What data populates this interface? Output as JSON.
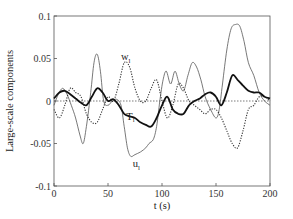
{
  "chart_data": {
    "type": "line",
    "title": "",
    "xlabel": "t (s)",
    "ylabel": "Large-scale components",
    "xlim": [
      0,
      200
    ],
    "ylim": [
      -0.1,
      0.1
    ],
    "xticks": [
      0,
      50,
      100,
      150,
      200
    ],
    "xtick_labels": [
      "0",
      "50",
      "100",
      "150",
      "200"
    ],
    "yticks": [
      -0.1,
      -0.05,
      0,
      0.05,
      0.1
    ],
    "ytick_labels": [
      "-0.1",
      "-0.05",
      "0",
      "0.05",
      "0.1"
    ],
    "grid": false,
    "zero_line": {
      "style": "dotted",
      "y": 0
    },
    "legend": "inline annotations",
    "annotations": [
      {
        "text": "w",
        "sub": "l",
        "t": 62,
        "v": 0.048,
        "series": "w_l"
      },
      {
        "text": "T",
        "sub": "l",
        "t": 67,
        "v": -0.022,
        "series": "T_l"
      },
      {
        "text": "u",
        "sub": "l",
        "t": 73,
        "v": -0.078,
        "series": "u_l"
      }
    ],
    "series": [
      {
        "name": "u_l",
        "style": "thin-solid",
        "color": "#555555",
        "x": [
          0,
          4,
          8,
          12,
          16,
          20,
          24,
          27,
          30,
          34,
          37,
          40,
          43,
          46,
          50,
          54,
          58,
          62,
          65,
          68,
          71,
          75,
          80,
          85,
          88,
          92,
          95,
          98,
          101,
          104,
          108,
          112,
          116,
          120,
          124,
          128,
          132,
          136,
          140,
          145,
          150,
          153,
          156,
          160,
          164,
          168,
          172,
          176,
          180,
          185,
          190,
          195,
          200
        ],
        "values": [
          -0.005,
          0.008,
          0.015,
          0.008,
          -0.005,
          -0.02,
          -0.04,
          -0.05,
          -0.03,
          0.01,
          0.045,
          0.055,
          0.035,
          0.0,
          -0.005,
          0.0,
          0.002,
          -0.005,
          -0.03,
          -0.055,
          -0.065,
          -0.063,
          -0.06,
          -0.055,
          -0.05,
          -0.045,
          -0.03,
          0.0,
          0.025,
          0.035,
          0.02,
          0.035,
          0.02,
          0.012,
          0.03,
          0.045,
          0.04,
          0.025,
          0.005,
          -0.01,
          -0.02,
          -0.01,
          0.02,
          0.06,
          0.085,
          0.09,
          0.088,
          0.07,
          0.045,
          0.03,
          0.01,
          0.0,
          -0.005
        ]
      },
      {
        "name": "w_l",
        "style": "dotted",
        "color": "#333333",
        "x": [
          0,
          5,
          10,
          15,
          20,
          25,
          30,
          35,
          40,
          45,
          50,
          55,
          60,
          65,
          70,
          75,
          80,
          85,
          90,
          95,
          100,
          105,
          110,
          115,
          120,
          125,
          130,
          135,
          140,
          145,
          150,
          155,
          160,
          165,
          170,
          175,
          180,
          185,
          190,
          195,
          200
        ],
        "values": [
          -0.01,
          -0.02,
          -0.005,
          0.015,
          0.01,
          0.005,
          -0.015,
          -0.025,
          -0.025,
          -0.01,
          0.005,
          0.0,
          0.02,
          0.045,
          0.04,
          0.015,
          0.0,
          0.0,
          0.015,
          0.025,
          0.0,
          -0.02,
          -0.005,
          0.02,
          0.015,
          0.0,
          -0.005,
          -0.01,
          -0.015,
          -0.01,
          -0.01,
          -0.02,
          -0.035,
          -0.05,
          -0.055,
          -0.035,
          -0.01,
          -0.005,
          0.005,
          0.005,
          0.0
        ]
      },
      {
        "name": "T_l",
        "style": "thick-solid",
        "color": "#111111",
        "x": [
          0,
          5,
          10,
          15,
          20,
          25,
          30,
          35,
          40,
          45,
          50,
          55,
          60,
          65,
          70,
          75,
          80,
          85,
          90,
          95,
          100,
          105,
          110,
          115,
          120,
          125,
          130,
          135,
          140,
          145,
          150,
          155,
          160,
          165,
          170,
          175,
          180,
          185,
          190,
          195,
          200
        ],
        "values": [
          0.003,
          0.01,
          0.012,
          0.008,
          0.003,
          -0.002,
          -0.005,
          0.005,
          0.015,
          0.01,
          0.0,
          0.002,
          -0.005,
          -0.015,
          -0.018,
          -0.02,
          -0.025,
          -0.028,
          -0.03,
          -0.02,
          -0.005,
          0.005,
          -0.01,
          -0.015,
          -0.015,
          -0.005,
          0.0,
          0.003,
          0.008,
          0.01,
          0.005,
          -0.005,
          0.01,
          0.03,
          0.025,
          0.018,
          0.012,
          0.01,
          0.01,
          0.005,
          0.003
        ]
      }
    ]
  }
}
